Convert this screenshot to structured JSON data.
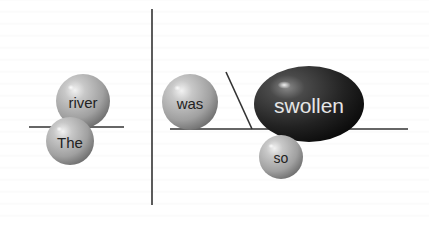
{
  "diagram": {
    "type": "sentence-diagram",
    "sentence": "The river was so swollen",
    "colors": {
      "background": "#ffffff",
      "line": "#333333",
      "sphere_light": "#d9d9d9",
      "sphere_mid": "#a8a8a8",
      "sphere_dark": "#6e6e6e",
      "dark_sphere_light": "#7a7a7a",
      "dark_sphere_mid": "#2e2e2e",
      "dark_sphere_dark": "#0e0e0e",
      "label_dark": "#222222",
      "label_light": "#e6e6e6"
    },
    "lines": [
      {
        "id": "divider-vertical",
        "x1": 152,
        "y1": 9,
        "x2": 152,
        "y2": 205
      },
      {
        "id": "subject-baseline",
        "x1": 29,
        "y1": 127,
        "x2": 124,
        "y2": 127
      },
      {
        "id": "predicate-baseline",
        "x1": 170,
        "y1": 129,
        "x2": 408,
        "y2": 129
      },
      {
        "id": "complement-slash",
        "x1": 226,
        "y1": 72,
        "x2": 252,
        "y2": 129
      }
    ],
    "nodes": [
      {
        "id": "river",
        "label": "river",
        "cx": 83,
        "cy": 101,
        "rx": 27,
        "ry": 27,
        "style": "light",
        "font_size": 15
      },
      {
        "id": "the",
        "label": "The",
        "cx": 70,
        "cy": 141,
        "rx": 24,
        "ry": 24,
        "style": "light",
        "font_size": 15
      },
      {
        "id": "was",
        "label": "was",
        "cx": 190,
        "cy": 102,
        "rx": 28,
        "ry": 28,
        "style": "light",
        "font_size": 15
      },
      {
        "id": "swollen",
        "label": "swollen",
        "cx": 309,
        "cy": 104,
        "rx": 55,
        "ry": 38,
        "style": "dark",
        "font_size": 21
      },
      {
        "id": "so",
        "label": "so",
        "cx": 281,
        "cy": 157,
        "rx": 22,
        "ry": 22,
        "style": "light",
        "font_size": 14
      }
    ]
  }
}
